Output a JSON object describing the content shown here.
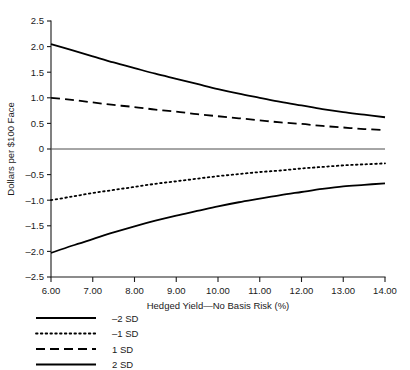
{
  "chart_data": {
    "type": "line",
    "title": "",
    "xlabel": "Hedged Yield—No Basis Risk (%)",
    "ylabel": "Dollars per $100 Face",
    "xlim": [
      6.0,
      14.0
    ],
    "ylim": [
      -2.5,
      2.5
    ],
    "grid": false,
    "legend_position": "below-left",
    "x_tick_labels": [
      "6.00",
      "7.00",
      "8.00",
      "9.00",
      "10.00",
      "11.00",
      "12.00",
      "13.00",
      "14.00"
    ],
    "x_ticks": [
      6.0,
      7.0,
      8.0,
      9.0,
      10.0,
      11.0,
      12.0,
      13.0,
      14.0
    ],
    "y_tick_labels": [
      "2.5",
      "2.0",
      "1.5",
      "1.0",
      "0.5",
      "0",
      "–0.5",
      "–1.0",
      "–1.5",
      "–2.0",
      "–2.5"
    ],
    "y_ticks": [
      2.5,
      2.0,
      1.5,
      1.0,
      0.5,
      0,
      -0.5,
      -1.0,
      -1.5,
      -2.0,
      -2.5
    ],
    "x": [
      6.0,
      6.5,
      7.0,
      7.5,
      8.0,
      8.5,
      9.0,
      9.5,
      10.0,
      10.5,
      11.0,
      11.5,
      12.0,
      12.5,
      13.0,
      13.5,
      14.0
    ],
    "series": [
      {
        "name": "2 SD",
        "style": "solid",
        "color": "#000000",
        "width": 1.8,
        "values": [
          2.05,
          1.93,
          1.81,
          1.69,
          1.58,
          1.47,
          1.37,
          1.27,
          1.17,
          1.08,
          1.0,
          0.92,
          0.85,
          0.78,
          0.72,
          0.67,
          0.62
        ]
      },
      {
        "name": "1 SD",
        "style": "dashed",
        "color": "#000000",
        "width": 1.8,
        "values": [
          1.0,
          0.96,
          0.91,
          0.86,
          0.82,
          0.77,
          0.73,
          0.68,
          0.64,
          0.6,
          0.56,
          0.52,
          0.49,
          0.45,
          0.42,
          0.39,
          0.37
        ]
      },
      {
        "name": "–1 SD",
        "style": "dotted",
        "color": "#000000",
        "width": 1.8,
        "values": [
          -1.0,
          -0.93,
          -0.86,
          -0.8,
          -0.74,
          -0.68,
          -0.63,
          -0.58,
          -0.53,
          -0.49,
          -0.45,
          -0.42,
          -0.38,
          -0.35,
          -0.32,
          -0.3,
          -0.28
        ]
      },
      {
        "name": "–2 SD",
        "style": "solid",
        "color": "#000000",
        "width": 1.8,
        "values": [
          -2.03,
          -1.89,
          -1.76,
          -1.63,
          -1.51,
          -1.4,
          -1.3,
          -1.21,
          -1.12,
          -1.04,
          -0.97,
          -0.9,
          -0.84,
          -0.78,
          -0.73,
          -0.7,
          -0.67
        ]
      }
    ],
    "legend": [
      {
        "label": "–2 SD",
        "style": "solid"
      },
      {
        "label": "–1 SD",
        "style": "dotted"
      },
      {
        "label": "1 SD",
        "style": "dashed"
      },
      {
        "label": "2 SD",
        "style": "solid"
      }
    ]
  }
}
